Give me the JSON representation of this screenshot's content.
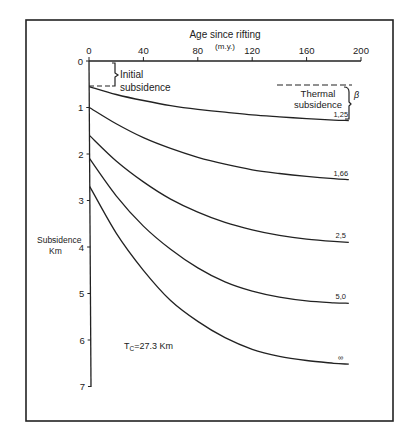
{
  "chart_data": {
    "type": "line",
    "title": "",
    "xlabel": "Age since rifting",
    "xlabel_units": "(m.y.)",
    "ylabel": "Subsidence",
    "ylabel_units": "Km",
    "x_axis_position": "top",
    "y_axis_inverted": true,
    "xlim": [
      0,
      200
    ],
    "ylim": [
      0,
      7
    ],
    "x_ticks": [
      0,
      40,
      80,
      120,
      160,
      200
    ],
    "y_ticks": [
      0,
      1,
      2,
      3,
      4,
      5,
      6,
      7
    ],
    "grid": false,
    "legend_position": "inline labels at right end of each curve",
    "series": [
      {
        "name": "1.25",
        "label": "1,25",
        "beta": 1.25,
        "x": [
          0,
          20,
          40,
          60,
          80,
          100,
          120,
          140,
          160,
          180,
          191
        ],
        "values": [
          0.55,
          0.72,
          0.85,
          0.96,
          1.04,
          1.1,
          1.16,
          1.2,
          1.24,
          1.27,
          1.28
        ]
      },
      {
        "name": "1.66",
        "label": "1,66",
        "beta": 1.66,
        "x": [
          0,
          20,
          40,
          60,
          80,
          100,
          120,
          140,
          160,
          180,
          191
        ],
        "values": [
          1.0,
          1.35,
          1.65,
          1.88,
          2.07,
          2.22,
          2.34,
          2.42,
          2.48,
          2.53,
          2.55
        ]
      },
      {
        "name": "2.5",
        "label": "2,5",
        "beta": 2.5,
        "x": [
          0,
          20,
          40,
          60,
          80,
          100,
          120,
          140,
          160,
          180,
          191
        ],
        "values": [
          1.6,
          2.15,
          2.6,
          2.97,
          3.25,
          3.47,
          3.63,
          3.75,
          3.83,
          3.88,
          3.9
        ]
      },
      {
        "name": "5.0",
        "label": "5,0",
        "beta": 5.0,
        "x": [
          0,
          20,
          40,
          60,
          80,
          100,
          120,
          140,
          160,
          180,
          191
        ],
        "values": [
          2.1,
          2.9,
          3.55,
          4.05,
          4.45,
          4.75,
          4.95,
          5.08,
          5.16,
          5.2,
          5.21
        ]
      },
      {
        "name": "infinity",
        "label": "∞",
        "beta": "∞",
        "x": [
          0,
          20,
          40,
          60,
          80,
          100,
          120,
          140,
          160,
          180,
          191
        ],
        "values": [
          2.7,
          3.7,
          4.5,
          5.15,
          5.6,
          5.95,
          6.2,
          6.35,
          6.44,
          6.5,
          6.52
        ]
      }
    ],
    "annotations": [
      {
        "text": "Initial subsidence",
        "type": "brace",
        "x": 0,
        "y_from": 0,
        "y_to": 0.55
      },
      {
        "text": "Thermal subsidence",
        "type": "brace",
        "x": 200,
        "y_from": 0.55,
        "y_to": 1.28
      },
      {
        "text": "β",
        "type": "label",
        "note": "curves labeled by β stretching factor"
      },
      {
        "text": "Tc=27.3 Km",
        "type": "label"
      }
    ]
  },
  "labels": {
    "x_title": "Age since rifting",
    "x_units": "(m.y.)",
    "y_title": "Subsidence",
    "y_units": "Km",
    "x_tick_labels": [
      "0",
      "40",
      "80",
      "120",
      "160",
      "200"
    ],
    "y_tick_labels": [
      "0",
      "1",
      "2",
      "3",
      "4",
      "5",
      "6",
      "7"
    ],
    "initial_1": "Initial",
    "initial_2": "subsidence",
    "thermal_1": "Thermal",
    "thermal_2": "subsidence",
    "beta": "β",
    "tc_prefix": "T",
    "tc_sub": "C",
    "tc_value": "=27.3 Km",
    "curve_labels": [
      "1,25",
      "1,66",
      "2,5",
      "5,0",
      "∞"
    ]
  },
  "colors": {
    "ink": "#222222",
    "background": "#ffffff"
  }
}
